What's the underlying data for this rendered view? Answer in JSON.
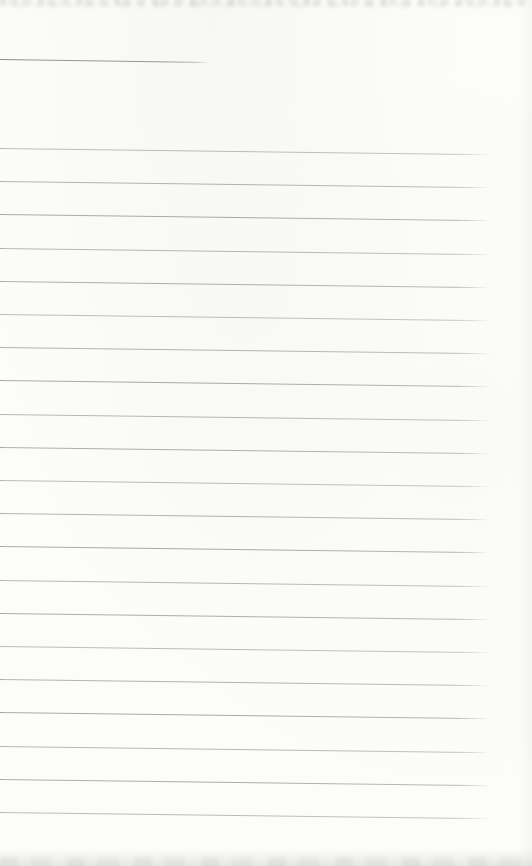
{
  "document": {
    "kind": "scanned blank ruled notebook page",
    "readable_text": "",
    "top_edge_text": {
      "legible": false,
      "note": "cut-off faint line of print at top edge"
    },
    "bottom_edge_band": {
      "legible": false,
      "note": "faint gray mottled band at bottom edge"
    }
  },
  "colors": {
    "paper": "#fcfcfb",
    "rule_line": "#ababab",
    "title_rule": "#919190"
  },
  "ruled_lines": {
    "count": 21,
    "first_top_px": 148,
    "spacing_px": 33.2,
    "length_px": 493,
    "slant_deg": 0.72
  },
  "title_rule": {
    "top_px": 59,
    "length_px": 208,
    "slant_deg": 0.85
  }
}
